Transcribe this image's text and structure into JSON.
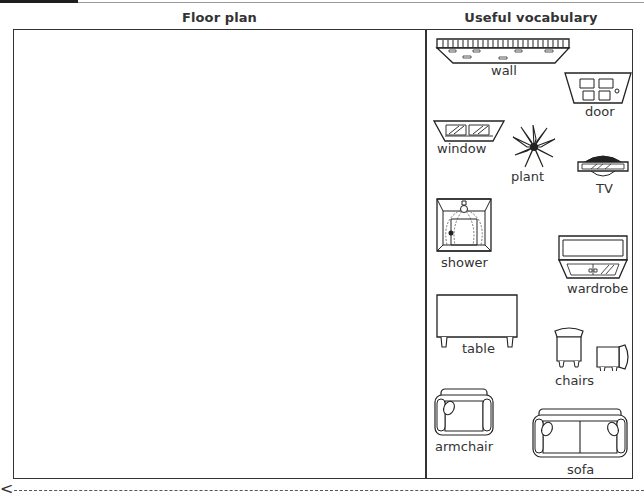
{
  "header": {
    "left_title": "Floor plan",
    "right_title": "Useful vocabulary"
  },
  "vocabulary": {
    "items": [
      {
        "label": "wall",
        "icon": "wall-icon"
      },
      {
        "label": "door",
        "icon": "door-icon"
      },
      {
        "label": "window",
        "icon": "window-icon"
      },
      {
        "label": "plant",
        "icon": "plant-icon"
      },
      {
        "label": "TV",
        "icon": "tv-icon"
      },
      {
        "label": "shower",
        "icon": "shower-icon"
      },
      {
        "label": "wardrobe",
        "icon": "wardrobe-icon"
      },
      {
        "label": "table",
        "icon": "table-icon"
      },
      {
        "label": "chairs",
        "icon": "chairs-icon"
      },
      {
        "label": "armchair",
        "icon": "armchair-icon"
      },
      {
        "label": "sofa",
        "icon": "sofa-icon"
      }
    ]
  },
  "cut_line": {
    "icon": "scissors-icon",
    "glyph": "<"
  }
}
